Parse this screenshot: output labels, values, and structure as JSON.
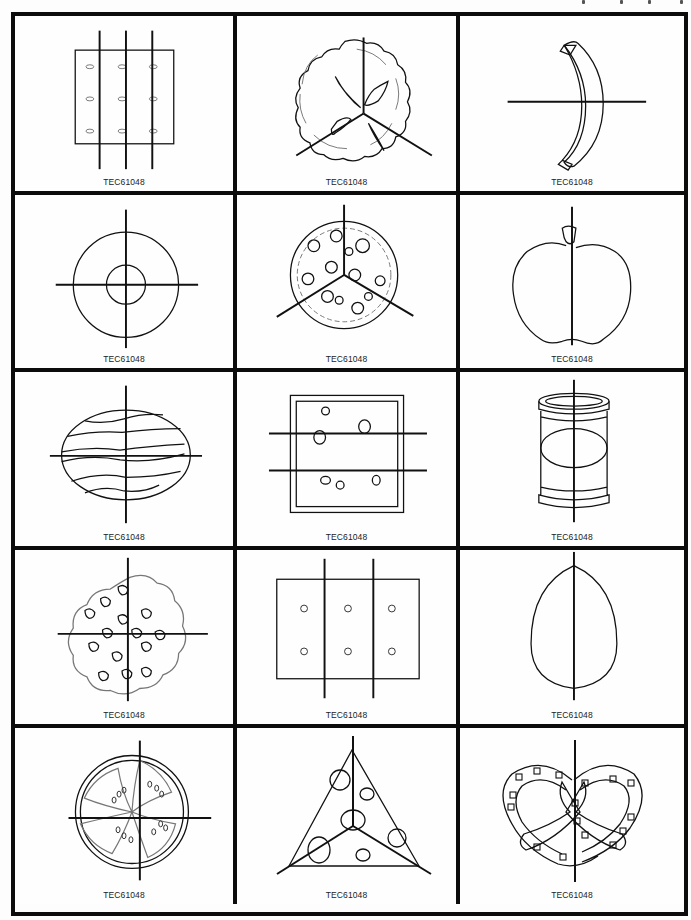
{
  "page": {
    "header_fragment": "(cut off, illegible)"
  },
  "card_code": "TEC61048",
  "cards": [
    {
      "name": "cracker",
      "divisions": "fourths (vertical lines)",
      "code": "TEC61048"
    },
    {
      "name": "pie",
      "divisions": "thirds",
      "code": "TEC61048"
    },
    {
      "name": "banana",
      "divisions": "halves",
      "code": "TEC61048"
    },
    {
      "name": "donut",
      "divisions": "fourths",
      "code": "TEC61048"
    },
    {
      "name": "pizza",
      "divisions": "thirds",
      "code": "TEC61048"
    },
    {
      "name": "apple",
      "divisions": "halves",
      "code": "TEC61048"
    },
    {
      "name": "watermelon",
      "divisions": "fourths",
      "code": "TEC61048"
    },
    {
      "name": "sandwich",
      "divisions": "thirds (horizontal lines)",
      "code": "TEC61048"
    },
    {
      "name": "can",
      "divisions": "halves",
      "code": "TEC61048"
    },
    {
      "name": "cookie",
      "divisions": "fourths",
      "code": "TEC61048"
    },
    {
      "name": "graham-cracker",
      "divisions": "thirds (vertical lines)",
      "code": "TEC61048"
    },
    {
      "name": "egg",
      "divisions": "halves",
      "code": "TEC61048"
    },
    {
      "name": "tomato-slice",
      "divisions": "fourths",
      "code": "TEC61048"
    },
    {
      "name": "cheese-wedge",
      "divisions": "thirds",
      "code": "TEC61048"
    },
    {
      "name": "pretzel",
      "divisions": "halves",
      "code": "TEC61048"
    }
  ],
  "colors": {
    "border": "#0c0c0c",
    "line": "#111111",
    "background": "#fdfdfd"
  }
}
